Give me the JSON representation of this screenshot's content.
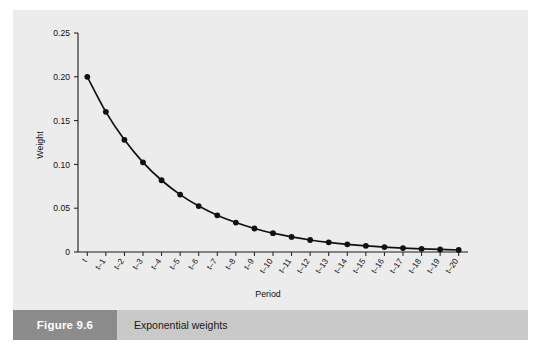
{
  "figure": {
    "number_label": "Figure 9.6",
    "caption": "Exponential weights",
    "number_block_color": "#8c8c8c",
    "caption_bar_color": "#c9c9c9",
    "panel_color": "#ececec"
  },
  "chart_data": {
    "type": "line",
    "title": "",
    "xlabel": "Period",
    "ylabel": "Weight",
    "categories": [
      "t",
      "t–1",
      "t–2",
      "t–3",
      "t–4",
      "t–5",
      "t–6",
      "t–7",
      "t–8",
      "t–9",
      "t–10",
      "t–11",
      "t–12",
      "t–13",
      "t–14",
      "t–15",
      "t–16",
      "t–17",
      "t–18",
      "t–19",
      "t–20"
    ],
    "values": [
      0.2,
      0.16,
      0.128,
      0.1024,
      0.0819,
      0.0655,
      0.0524,
      0.0419,
      0.0336,
      0.0268,
      0.0215,
      0.0172,
      0.0137,
      0.011,
      0.0088,
      0.007,
      0.0056,
      0.0045,
      0.0036,
      0.0029,
      0.0023
    ],
    "series_name": "Exponential weights",
    "ylim": [
      0,
      0.25
    ],
    "yticks": [
      0,
      0.05,
      0.1,
      0.15,
      0.2,
      0.25
    ],
    "ytick_labels": [
      "0",
      "0.05",
      "0.10",
      "0.15",
      "0.20",
      "0.25"
    ],
    "grid": false,
    "legend": "none",
    "marker": "filled-circle",
    "line_color": "#111111",
    "formula_note": "w_k = 0.2 x 0.8^k"
  }
}
